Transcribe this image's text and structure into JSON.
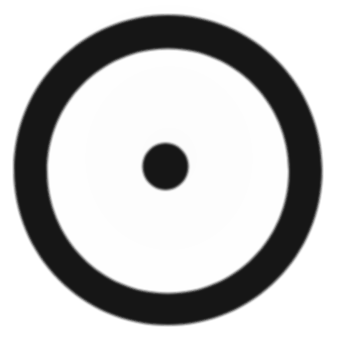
{
  "document": {
    "type": "scanned-drawing",
    "title": "Circle with concentric center dot",
    "symbol_name": "sun-symbol",
    "symbol_glyph": "⊙",
    "description": "A hand-drawn thick black ring with a small filled black dot at its center on white paper.",
    "canvas": {
      "width": 338,
      "height": 344,
      "background_color": "#ffffff"
    }
  },
  "ink": {
    "color": "#141414",
    "edge_softness_px": 1.4
  },
  "figure": {
    "outer_ring": {
      "name": "outer-ring",
      "center_x": 168,
      "center_y": 172,
      "outer_diameter": 308,
      "inner_diameter": 242,
      "stroke_width": 33,
      "color": "#141414"
    },
    "center_dot": {
      "name": "center-dot",
      "center_x": 165.5,
      "center_y": 166.5,
      "diameter": 46,
      "color": "#141414"
    }
  },
  "chart_data": {
    "type": "scatter",
    "title": "Circle with concentric center dot",
    "xlabel": "",
    "ylabel": "",
    "xlim": [
      0,
      338
    ],
    "ylim": [
      0,
      344
    ],
    "grid": false,
    "legend": "none",
    "series": [
      {
        "name": "outer-ring",
        "shape": "annulus",
        "center": [
          168,
          172
        ],
        "outer_radius": 154,
        "inner_radius": 121,
        "stroke_width": 33,
        "color": "#141414"
      },
      {
        "name": "center-dot",
        "shape": "disc",
        "center": [
          165.5,
          166.5
        ],
        "radius": 23,
        "color": "#141414"
      }
    ],
    "annotations": []
  }
}
